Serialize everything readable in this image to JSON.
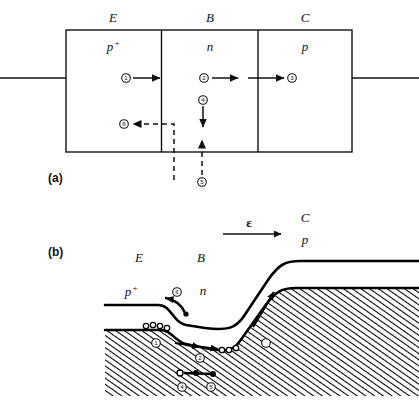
{
  "figure": {
    "panel_a": {
      "label": "(a)",
      "region_labels": {
        "emitter": "E",
        "base": "B",
        "collector": "C"
      },
      "doping_labels": {
        "emitter": "p",
        "emitter_sup": "+",
        "base": "n",
        "collector": "p"
      },
      "markers": [
        "1",
        "2",
        "3",
        "4",
        "5",
        "6"
      ]
    },
    "panel_b": {
      "label": "(b)",
      "region_labels": {
        "emitter": "E",
        "base": "B",
        "collector": "C"
      },
      "doping_labels": {
        "emitter": "p",
        "emitter_sup": "+",
        "base": "n",
        "collector": "p"
      },
      "field_label": "ε",
      "markers": [
        "1",
        "2",
        "3",
        "4",
        "5",
        "6"
      ]
    }
  },
  "colors": {
    "ink": "#111111",
    "background": "#ffffff",
    "hatch": "#000000"
  }
}
